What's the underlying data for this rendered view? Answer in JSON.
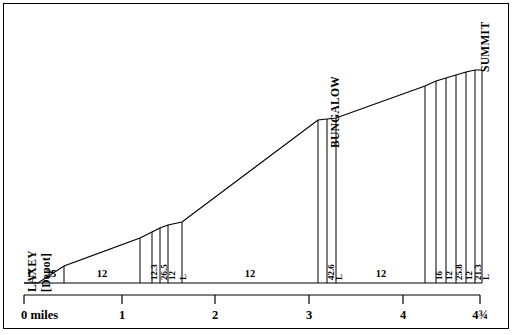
{
  "figure": {
    "ink_color": "#000000",
    "background": "#ffffff"
  },
  "chart_data": {
    "type": "line",
    "title": "",
    "xlabel": "",
    "ylabel": "",
    "xlim": [
      0,
      4.75
    ],
    "grid": false,
    "legend": null,
    "axis": {
      "tick_values": [
        0,
        1,
        2,
        3,
        4,
        4.75
      ],
      "tick_labels": [
        "0 miles",
        "1",
        "2",
        "3",
        "4",
        "4¾"
      ],
      "tick_x_px": [
        24,
        122,
        215,
        309,
        403,
        480
      ]
    },
    "place_labels": [
      {
        "text": "LAXEY",
        "x_px": 27,
        "y_px": 292,
        "orientation": "vertical"
      },
      {
        "text": "[Depot]",
        "x_px": 41,
        "y_px": 292,
        "orientation": "vertical"
      },
      {
        "text": "BUNGALOW",
        "x_px": 330,
        "y_px": 148,
        "orientation": "vertical"
      },
      {
        "text": "SUMMIT",
        "x_px": 480,
        "y_px": 72,
        "orientation": "vertical"
      }
    ],
    "gradient_sections": [
      {
        "label": "L",
        "x0_px": 24,
        "x1_px": 38,
        "label_x_px": 31,
        "orientation": "horizontal"
      },
      {
        "label": "25",
        "x0_px": 38,
        "x1_px": 64,
        "label_x_px": 51,
        "orientation": "horizontal"
      },
      {
        "label": "12",
        "x0_px": 64,
        "x1_px": 140,
        "label_x_px": 102,
        "orientation": "horizontal"
      },
      {
        "label": "12.3",
        "x0_px": 140,
        "x1_px": 152,
        "label_x_px": 146,
        "orientation": "vertical"
      },
      {
        "label": "26.5",
        "x0_px": 152,
        "x1_px": 160,
        "label_x_px": 156,
        "orientation": "vertical"
      },
      {
        "label": "12",
        "x0_px": 160,
        "x1_px": 168,
        "label_x_px": 164,
        "orientation": "vertical"
      },
      {
        "label": "L",
        "x0_px": 168,
        "x1_px": 182,
        "label_x_px": 175,
        "orientation": "vertical"
      },
      {
        "label": "12",
        "x0_px": 182,
        "x1_px": 318,
        "label_x_px": 250,
        "orientation": "horizontal"
      },
      {
        "label": "42.6",
        "x0_px": 318,
        "x1_px": 327,
        "label_x_px": 323,
        "orientation": "vertical"
      },
      {
        "label": "L",
        "x0_px": 327,
        "x1_px": 336,
        "label_x_px": 331,
        "orientation": "vertical"
      },
      {
        "label": "12",
        "x0_px": 336,
        "x1_px": 425,
        "label_x_px": 381,
        "orientation": "horizontal"
      },
      {
        "label": "16",
        "x0_px": 425,
        "x1_px": 436,
        "label_x_px": 431,
        "orientation": "vertical"
      },
      {
        "label": "12",
        "x0_px": 436,
        "x1_px": 446,
        "label_x_px": 441,
        "orientation": "vertical"
      },
      {
        "label": "25.8",
        "x0_px": 446,
        "x1_px": 456,
        "label_x_px": 451,
        "orientation": "vertical"
      },
      {
        "label": "12",
        "x0_px": 456,
        "x1_px": 466,
        "label_x_px": 461,
        "orientation": "vertical"
      },
      {
        "label": "21.3",
        "x0_px": 466,
        "x1_px": 475,
        "label_x_px": 470,
        "orientation": "vertical"
      },
      {
        "label": "L",
        "x0_px": 475,
        "x1_px": 482,
        "label_x_px": 478,
        "orientation": "vertical"
      }
    ],
    "profile_points_px": [
      {
        "x": 24,
        "y": 283
      },
      {
        "x": 38,
        "y": 283
      },
      {
        "x": 64,
        "y": 266
      },
      {
        "x": 140,
        "y": 238
      },
      {
        "x": 152,
        "y": 232
      },
      {
        "x": 160,
        "y": 228
      },
      {
        "x": 168,
        "y": 225
      },
      {
        "x": 182,
        "y": 222
      },
      {
        "x": 318,
        "y": 120
      },
      {
        "x": 327,
        "y": 119
      },
      {
        "x": 336,
        "y": 118
      },
      {
        "x": 425,
        "y": 86
      },
      {
        "x": 436,
        "y": 81
      },
      {
        "x": 446,
        "y": 78
      },
      {
        "x": 456,
        "y": 75
      },
      {
        "x": 466,
        "y": 72
      },
      {
        "x": 475,
        "y": 70
      },
      {
        "x": 482,
        "y": 70
      }
    ],
    "baseline_y_px": 283,
    "gradient_row_y_px": 283,
    "axis_y_px": 295
  }
}
